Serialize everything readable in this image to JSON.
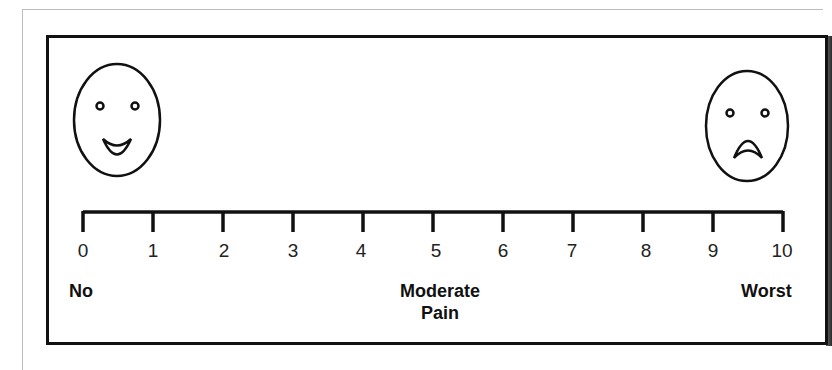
{
  "scale": {
    "title": "Pain rating scale 0-10",
    "ticks": [
      "0",
      "1",
      "2",
      "3",
      "4",
      "5",
      "6",
      "7",
      "8",
      "9",
      "10"
    ],
    "anchors": {
      "low": "No",
      "mid_line1": "Moderate",
      "mid_line2": "Pain",
      "high": "Worst"
    },
    "faces": {
      "left": "happy-face",
      "right": "sad-face"
    }
  },
  "colors": {
    "line": "#111111",
    "text": "#222222",
    "background": "#ffffff"
  }
}
